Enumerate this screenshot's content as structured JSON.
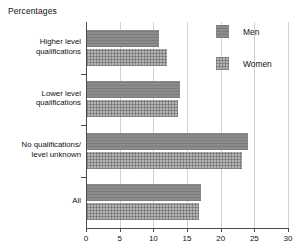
{
  "chart_data": {
    "type": "bar",
    "orientation": "horizontal",
    "title": "Percentages",
    "xlabel": "",
    "ylabel": "",
    "xlim": [
      0,
      30
    ],
    "xticks": [
      0,
      5,
      10,
      15,
      20,
      25,
      30
    ],
    "grid": true,
    "legend_position": "top-right",
    "categories": [
      "Higher level qualifications",
      "Lower level qualifications",
      "No qualifications/ level unknown",
      "All"
    ],
    "category_lines": [
      [
        "Higher level",
        "qualifications"
      ],
      [
        "Lower level",
        "qualifications"
      ],
      [
        "No qualifications/",
        "level unknown"
      ],
      [
        "All"
      ]
    ],
    "series": [
      {
        "name": "Men",
        "values": [
          10.9,
          14.0,
          24.0,
          17.1
        ],
        "color": "#8b8b8b"
      },
      {
        "name": "Women",
        "values": [
          12.1,
          13.7,
          23.2,
          16.8
        ],
        "color": "#b4b4b4"
      }
    ]
  },
  "legend": {
    "items": [
      {
        "label": "Men"
      },
      {
        "label": "Women"
      }
    ]
  },
  "axis": {
    "tick_labels": [
      "0",
      "5",
      "10",
      "15",
      "20",
      "25",
      "30"
    ]
  }
}
